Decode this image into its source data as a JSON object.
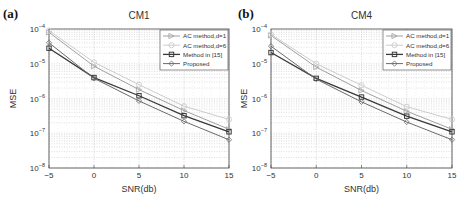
{
  "chart_data": [
    {
      "type": "line",
      "panel_label": "(a)",
      "title": "CM1",
      "xlabel": "SNR(db)",
      "ylabel": "MSE",
      "yscale": "log",
      "xlim": [
        -5,
        15
      ],
      "ylim": [
        1e-08,
        0.0001
      ],
      "x": [
        -5,
        0,
        5,
        10,
        15
      ],
      "xticks": [
        "-5",
        "0",
        "5",
        "10",
        "15"
      ],
      "yticks": [
        "10^-8",
        "10^-7",
        "10^-6",
        "10^-5",
        "10^-4"
      ],
      "grid": true,
      "legend_position": "upper right",
      "series": [
        {
          "name": "AC method,d=1",
          "marker": "triangle-right",
          "color": "#a0a0a0",
          "values": [
            8e-05,
            8.5e-06,
            1.8e-06,
            4.5e-07,
            1.3e-07
          ]
        },
        {
          "name": "AC method,d=6",
          "marker": "circle",
          "color": "#cccccc",
          "values": [
            9e-05,
            1.1e-05,
            2.5e-06,
            6e-07,
            2.5e-07
          ]
        },
        {
          "name": "Method in [15]",
          "marker": "square",
          "color": "#3a3a3a",
          "values": [
            2.8e-05,
            4e-06,
            1.2e-06,
            3.2e-07,
            1.1e-07
          ]
        },
        {
          "name": "Proposed",
          "marker": "diamond",
          "color": "#6a6a6a",
          "values": [
            4e-05,
            3.8e-06,
            8.5e-07,
            2.2e-07,
            6.5e-08
          ]
        }
      ]
    },
    {
      "type": "line",
      "panel_label": "(b)",
      "title": "CM4",
      "xlabel": "SNR(db)",
      "ylabel": "MSE",
      "yscale": "log",
      "xlim": [
        -5,
        15
      ],
      "ylim": [
        1e-08,
        0.0001
      ],
      "x": [
        -5,
        0,
        5,
        10,
        15
      ],
      "xticks": [
        "-5",
        "0",
        "5",
        "10",
        "15"
      ],
      "yticks": [
        "10^-8",
        "10^-7",
        "10^-6",
        "10^-5",
        "10^-4"
      ],
      "grid": true,
      "legend_position": "upper right",
      "series": [
        {
          "name": "AC method,d=1",
          "marker": "triangle-right",
          "color": "#a0a0a0",
          "values": [
            6.5e-05,
            8e-06,
            1.7e-06,
            4.3e-07,
            1.3e-07
          ]
        },
        {
          "name": "AC method,d=6",
          "marker": "circle",
          "color": "#cccccc",
          "values": [
            7e-05,
            1e-05,
            2.4e-06,
            5.8e-07,
            2.5e-07
          ]
        },
        {
          "name": "Method in [15]",
          "marker": "square",
          "color": "#3a3a3a",
          "values": [
            2.1e-05,
            3.8e-06,
            1.1e-06,
            3.1e-07,
            1.1e-07
          ]
        },
        {
          "name": "Proposed",
          "marker": "diamond",
          "color": "#6a6a6a",
          "values": [
            3.2e-05,
            3.6e-06,
            8e-07,
            2.1e-07,
            6.5e-08
          ]
        }
      ]
    }
  ]
}
